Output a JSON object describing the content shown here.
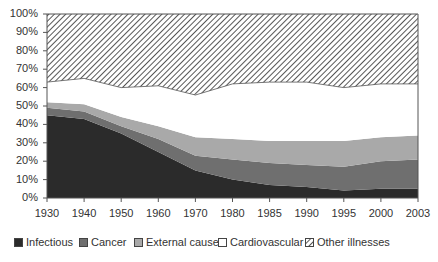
{
  "chart_data": {
    "type": "area",
    "stacked": true,
    "percent": true,
    "title": "",
    "xlabel": "",
    "ylabel": "",
    "ylim": [
      0,
      100
    ],
    "categories": [
      "1930",
      "1940",
      "1950",
      "1960",
      "1970",
      "1980",
      "1985",
      "1990",
      "1995",
      "2000",
      "2003"
    ],
    "y_ticks": [
      "0%",
      "10%",
      "20%",
      "30%",
      "40%",
      "50%",
      "60%",
      "70%",
      "80%",
      "90%",
      "100%"
    ],
    "grid": false,
    "legend_position": "bottom",
    "series": [
      {
        "name": "Infectious",
        "color": "#2b2b2b",
        "pattern": "solid",
        "values": [
          45,
          43,
          35,
          25,
          15,
          10,
          7,
          6,
          4,
          5,
          5
        ]
      },
      {
        "name": "Cancer",
        "color": "#6f6f6f",
        "pattern": "solid",
        "values": [
          4,
          4,
          4,
          7,
          8,
          11,
          12,
          12,
          13,
          15,
          16
        ]
      },
      {
        "name": "External causes",
        "color": "#a9a9a9",
        "pattern": "solid",
        "values": [
          3,
          4,
          5,
          7,
          10,
          11,
          12,
          13,
          14,
          13,
          13
        ]
      },
      {
        "name": "Cardiovascular",
        "color": "#ffffff",
        "pattern": "solid",
        "values": [
          11,
          14,
          16,
          22,
          23,
          30,
          32,
          32,
          29,
          29,
          28
        ]
      },
      {
        "name": "Other illnesses",
        "color": "#ffffff",
        "pattern": "hatched",
        "values": [
          37,
          35,
          40,
          39,
          44,
          38,
          37,
          37,
          40,
          38,
          38
        ]
      }
    ]
  },
  "legend": {
    "items": [
      {
        "label": "Infectious",
        "x": 14
      },
      {
        "label": "Cancer",
        "x": 79
      },
      {
        "label": "External causes",
        "x": 134
      },
      {
        "label": "Cardiovascular",
        "x": 218
      },
      {
        "label": "Other illnesses",
        "x": 305
      }
    ]
  }
}
